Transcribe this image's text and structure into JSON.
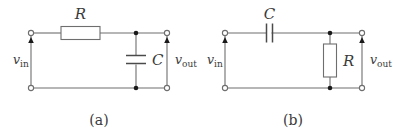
{
  "figure": {
    "background_color": "#ffffff",
    "wire_color": "#6e6e6e",
    "node_color": "#1a1a1a",
    "label_color": "#3a3a3a"
  },
  "circuits": [
    {
      "id": "a",
      "caption": "(a)",
      "type": "low-pass-rc",
      "input_label": {
        "symbol": "v",
        "subscript": "in"
      },
      "output_label": {
        "symbol": "v",
        "subscript": "out"
      },
      "components": [
        {
          "name": "resistor",
          "label": "R",
          "orientation": "horizontal",
          "position": "series-top"
        },
        {
          "name": "capacitor",
          "label": "C",
          "orientation": "vertical",
          "position": "shunt"
        }
      ],
      "terminals": 4,
      "junctions": 2
    },
    {
      "id": "b",
      "caption": "(b)",
      "type": "high-pass-rc",
      "input_label": {
        "symbol": "v",
        "subscript": "in"
      },
      "output_label": {
        "symbol": "v",
        "subscript": "out"
      },
      "components": [
        {
          "name": "capacitor",
          "label": "C",
          "orientation": "horizontal",
          "position": "series-top"
        },
        {
          "name": "resistor",
          "label": "R",
          "orientation": "vertical",
          "position": "shunt"
        }
      ],
      "terminals": 4,
      "junctions": 2
    }
  ]
}
